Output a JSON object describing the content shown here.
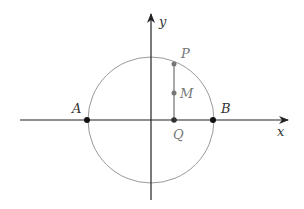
{
  "diagram": {
    "type": "coordinate-circle",
    "colors": {
      "axis": "#222222",
      "circle": "#999999",
      "segment": "#555555",
      "point_dark": "#111111",
      "point_gray": "#777777"
    },
    "axes": {
      "x_label": "x",
      "y_label": "y"
    },
    "points": {
      "A": {
        "label": "A"
      },
      "B": {
        "label": "B"
      },
      "P": {
        "label": "P"
      },
      "M": {
        "label": "M"
      },
      "Q": {
        "label": "Q"
      }
    }
  }
}
